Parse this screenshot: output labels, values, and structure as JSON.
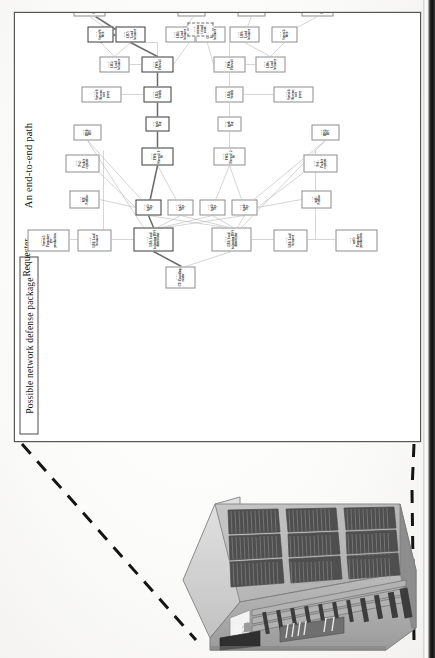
{
  "page": {
    "type": "scanned-figure-page",
    "background": "#fdfdfc",
    "edge_color": "#111111"
  },
  "figure": {
    "titles": {
      "defense_package": "Possible network defense package",
      "end_to_end_path": "An end-to-end path",
      "requester": "Requester"
    },
    "frame_border_color": "#555555",
    "node_border_color": "#8d8d8d",
    "highlight_path_color": "#4a4a4a"
  },
  "nodes": [
    {
      "id": "n-requester",
      "kind": "node:",
      "title": "CT: Encoding router",
      "x": 152,
      "y": 150,
      "w": 22,
      "h": 30,
      "style": "plain"
    },
    {
      "id": "n-lb-top",
      "kind": "block:",
      "title": "LB1: Load balancing DNS distributor",
      "x": 189,
      "y": 118,
      "w": 24,
      "h": 40,
      "style": "hl"
    },
    {
      "id": "n-lb-bot",
      "kind": "block:",
      "title": "LB1: Load balancing DNS distributor",
      "x": 189,
      "y": 196,
      "w": 24,
      "h": 40,
      "style": "plain"
    },
    {
      "id": "n-lb-up1",
      "kind": "block:",
      "title": "LB1: Load balancer",
      "x": 189,
      "y": 62,
      "w": 22,
      "h": 34,
      "style": "plain"
    },
    {
      "id": "n-srv2",
      "kind": "block:",
      "title": "Server2: Purgatory pre-production",
      "x": 189,
      "y": 12,
      "w": 22,
      "h": 42,
      "style": "plain"
    },
    {
      "id": "n-lb-dn1",
      "kind": "block:",
      "title": "LB1: Load balancer",
      "x": 189,
      "y": 258,
      "w": 22,
      "h": 34,
      "style": "plain"
    },
    {
      "id": "n-net1",
      "kind": "block:",
      "title": "net1: Purgatory production",
      "x": 189,
      "y": 320,
      "w": 22,
      "h": 42,
      "style": "plain"
    },
    {
      "id": "n-tap1",
      "kind": "block:",
      "title": "tap1: Tap",
      "x": 225,
      "y": 120,
      "w": 16,
      "h": 26,
      "style": "hl"
    },
    {
      "id": "n-tap2",
      "kind": "block:",
      "title": "tap2: Tap",
      "x": 225,
      "y": 152,
      "w": 16,
      "h": 26,
      "style": "plain"
    },
    {
      "id": "n-tap3",
      "kind": "block:",
      "title": "tap3: Tap",
      "x": 225,
      "y": 184,
      "w": 16,
      "h": 26,
      "style": "plain"
    },
    {
      "id": "n-tap4",
      "kind": "block:",
      "title": "tap4: Tap",
      "x": 225,
      "y": 216,
      "w": 16,
      "h": 26,
      "style": "plain"
    },
    {
      "id": "n-mt-netflow",
      "kind": "block:",
      "title": "MT: Netflow",
      "x": 232,
      "y": 54,
      "w": 18,
      "h": 30,
      "style": "plain"
    },
    {
      "id": "n-int1",
      "kind": "block:",
      "title": "int1: Netflow",
      "x": 232,
      "y": 286,
      "w": 18,
      "h": 30,
      "style": "plain"
    },
    {
      "id": "n-pv2",
      "kind": "block:",
      "title": "Pv2: Packet capture",
      "x": 268,
      "y": 50,
      "w": 18,
      "h": 34,
      "style": "plain"
    },
    {
      "id": "n-pv1",
      "kind": "block:",
      "title": "Pv1: Packet capture",
      "x": 268,
      "y": 288,
      "w": 18,
      "h": 34,
      "style": "plain"
    },
    {
      "id": "n-fw1",
      "kind": "block:",
      "title": "FW1: Firewall 1-W",
      "x": 275,
      "y": 126,
      "w": 18,
      "h": 32,
      "style": "hl"
    },
    {
      "id": "n-fw2",
      "kind": "block:",
      "title": "FW2: Firewall 2-W",
      "x": 275,
      "y": 198,
      "w": 18,
      "h": 32,
      "style": "plain"
    },
    {
      "id": "n-ids1",
      "kind": "block:",
      "title": "IDS1: IDS",
      "x": 300,
      "y": 58,
      "w": 16,
      "h": 28,
      "style": "plain"
    },
    {
      "id": "n-ids2",
      "kind": "block:",
      "title": "IDS2: IDS",
      "x": 300,
      "y": 296,
      "w": 16,
      "h": 28,
      "style": "plain"
    },
    {
      "id": "n-tap5",
      "kind": "block:",
      "title": "tap5: Tap",
      "x": 309,
      "y": 130,
      "w": 15,
      "h": 24,
      "style": "hl"
    },
    {
      "id": "n-tap6",
      "kind": "block:",
      "title": "tap6: Tap",
      "x": 309,
      "y": 202,
      "w": 15,
      "h": 24,
      "style": "plain"
    },
    {
      "id": "n-lb3",
      "kind": "block:",
      "title": "LB3: Switch",
      "x": 338,
      "y": 128,
      "w": 16,
      "h": 28,
      "style": "hl"
    },
    {
      "id": "n-lb4",
      "kind": "block:",
      "title": "LB4: Switch",
      "x": 338,
      "y": 200,
      "w": 16,
      "h": 28,
      "style": "plain"
    },
    {
      "id": "n-srv1-rev",
      "kind": "block:",
      "title": "Server1: Reverse web proxy",
      "x": 338,
      "y": 66,
      "w": 16,
      "h": 40,
      "style": "plain"
    },
    {
      "id": "n-srv3-rev",
      "kind": "block:",
      "title": "Server3: Reverse web proxy",
      "x": 338,
      "y": 258,
      "w": 16,
      "h": 40,
      "style": "plain"
    },
    {
      "id": "n-fw3",
      "kind": "block:",
      "title": "FW3: Firewall",
      "x": 368,
      "y": 126,
      "w": 16,
      "h": 32,
      "style": "hl"
    },
    {
      "id": "n-fw4",
      "kind": "block:",
      "title": "FW4: Firewall",
      "x": 368,
      "y": 198,
      "w": 16,
      "h": 32,
      "style": "plain"
    },
    {
      "id": "n-lb5",
      "kind": "block:",
      "title": "LB5: Load balancer",
      "x": 368,
      "y": 84,
      "w": 16,
      "h": 30,
      "style": "plain"
    },
    {
      "id": "n-lb6",
      "kind": "block:",
      "title": "LB6: Load balancer",
      "x": 368,
      "y": 240,
      "w": 16,
      "h": 30,
      "style": "plain"
    },
    {
      "id": "n-lb7",
      "kind": "block:",
      "title": "LB7: Load balancer",
      "x": 398,
      "y": 100,
      "w": 16,
      "h": 30,
      "style": "hl"
    },
    {
      "id": "n-lb8",
      "kind": "block:",
      "title": "LB8: Load balancer",
      "x": 398,
      "y": 150,
      "w": 16,
      "h": 30,
      "style": "plain"
    },
    {
      "id": "n-srv9",
      "kind": "block:",
      "title": "Server9: Web",
      "x": 398,
      "y": 72,
      "w": 16,
      "h": 26,
      "style": "hl"
    },
    {
      "id": "n-srv5",
      "kind": "block:",
      "title": "Server5: Web",
      "x": 398,
      "y": 256,
      "w": 16,
      "h": 26,
      "style": "plain"
    },
    {
      "id": "n-lb9",
      "kind": "block:",
      "title": "LB9: Load balancer",
      "x": 398,
      "y": 214,
      "w": 16,
      "h": 30,
      "style": "plain"
    },
    {
      "id": "n-lb10",
      "kind": "block:",
      "title": "LB10: Load balancer",
      "x": 398,
      "y": 180,
      "w": 16,
      "h": 30,
      "style": "plain"
    },
    {
      "id": "n-lb11",
      "kind": "block:",
      "title": "LB11: Load balancer",
      "x": 424,
      "y": 58,
      "w": 16,
      "h": 32,
      "style": "plain"
    },
    {
      "id": "n-lb12",
      "kind": "block:",
      "title": "LB12: Load balancer",
      "x": 424,
      "y": 286,
      "w": 16,
      "h": 32,
      "style": "plain"
    },
    {
      "id": "n-srv10",
      "kind": "block:",
      "title": "Server10: Web server pre-production",
      "x": 456,
      "y": 14,
      "w": 18,
      "h": 48,
      "style": "plain"
    },
    {
      "id": "n-srv11",
      "kind": "block:",
      "title": "Server11: Application pre-production",
      "x": 456,
      "y": 70,
      "w": 18,
      "h": 48,
      "style": "plain"
    },
    {
      "id": "n-srv12",
      "kind": "block:",
      "title": "Server12: Database pre-production",
      "x": 456,
      "y": 126,
      "w": 18,
      "h": 48,
      "style": "plain"
    },
    {
      "id": "n-srv6",
      "kind": "block:",
      "title": "Server6: Web server production",
      "x": 456,
      "y": 300,
      "w": 18,
      "h": 48,
      "style": "plain"
    },
    {
      "id": "n-srv7",
      "kind": "block:",
      "title": "Server7: Application production",
      "x": 456,
      "y": 250,
      "w": 18,
      "h": 48,
      "style": "plain"
    },
    {
      "id": "n-srv8",
      "kind": "block:",
      "title": "Server8: Database production",
      "x": 456,
      "y": 200,
      "w": 18,
      "h": 48,
      "style": "plain"
    },
    {
      "id": "n-fw5",
      "kind": "block:",
      "title": "FW5: DB W",
      "x": 424,
      "y": 162,
      "w": 16,
      "h": 28,
      "style": "plain"
    },
    {
      "id": "n-fw6",
      "kind": "block:",
      "title": "FW6: DB W",
      "x": 424,
      "y": 222,
      "w": 16,
      "h": 28,
      "style": "plain"
    },
    {
      "id": "n-cloud",
      "kind": "block:",
      "title": "external cloud route",
      "x": 404,
      "y": 172,
      "w": 14,
      "h": 26,
      "style": "cloud"
    }
  ],
  "rack": {
    "label": "server-rack-illustration",
    "body_color": "#9a9a9a",
    "top_color": "#b5b5b5",
    "side_color": "#d2d2d2",
    "vent_color": "#3b3b3b"
  },
  "connectors": {
    "style": "dashed",
    "color": "#141414",
    "width": 3
  }
}
